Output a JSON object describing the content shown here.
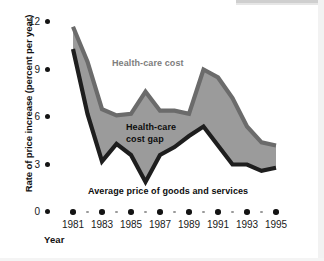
{
  "chart_data": {
    "type": "area",
    "title": "",
    "xlabel": "Year",
    "ylabel": "Rate of price increase (percent per year)",
    "x": [
      1981,
      1982,
      1983,
      1984,
      1985,
      1986,
      1987,
      1988,
      1989,
      1990,
      1991,
      1992,
      1993,
      1994,
      1995
    ],
    "xlim": [
      1980.6,
      1995.4
    ],
    "ylim": [
      0,
      12.6
    ],
    "yticks": [
      0,
      3,
      6,
      9,
      12
    ],
    "ytick_labels": [
      "0",
      "3",
      "6",
      "9",
      "12"
    ],
    "xticks": [
      1981,
      1983,
      1985,
      1987,
      1989,
      1991,
      1993,
      1995
    ],
    "xtick_labels": [
      "1981",
      "1983",
      "1985",
      "1987",
      "1989",
      "1991",
      "1993",
      "1995"
    ],
    "xticks_minor": [
      1982,
      1984,
      1986,
      1988,
      1990,
      1992,
      1994
    ],
    "grid": false,
    "legend_position": "inline-annotations",
    "series": [
      {
        "name": "Health-care cost",
        "values": [
          11.7,
          9.5,
          6.5,
          6.1,
          6.2,
          7.6,
          6.4,
          6.4,
          6.2,
          9.0,
          8.5,
          7.2,
          5.4,
          4.4,
          4.2
        ],
        "color": "#9b9b9b",
        "line_color": "#6b6b6b"
      },
      {
        "name": "Average price of goods and services",
        "values": [
          10.3,
          6.2,
          3.2,
          4.3,
          3.6,
          1.9,
          3.6,
          4.1,
          4.8,
          5.4,
          4.2,
          3.0,
          3.0,
          2.6,
          2.8
        ],
        "color": "#9b9b9b",
        "line_color": "#1e1e1e"
      }
    ],
    "band": {
      "name": "Health-care cost gap",
      "fill_color": "#9b9b9b",
      "between": [
        "Health-care cost",
        "Average price of goods and services"
      ]
    },
    "annotations": [
      {
        "text": "Health-care cost",
        "color": "#7d7d7d"
      },
      {
        "text": "Health-care cost gap",
        "lines": [
          "Health-care",
          "cost gap"
        ],
        "color": "#0d0d0d"
      },
      {
        "text": "Average price of goods and services",
        "color": "#0d0d0d"
      }
    ]
  },
  "labels": {
    "y_axis_title": "Rate of price increase (percent per year)",
    "x_axis_title": "Year",
    "annotation_healthcare_cost": "Health-care cost",
    "annotation_cost_gap_line1": "Health-care",
    "annotation_cost_gap_line2": "cost gap",
    "annotation_average_price": "Average price of goods and services"
  },
  "colors": {
    "band_fill": "#9b9b9b",
    "upper_line": "#6b6b6b",
    "lower_line": "#1e1e1e",
    "tick_dot": "#141414",
    "minor_dot": "#9a9a9a",
    "background": "#ffffff"
  }
}
